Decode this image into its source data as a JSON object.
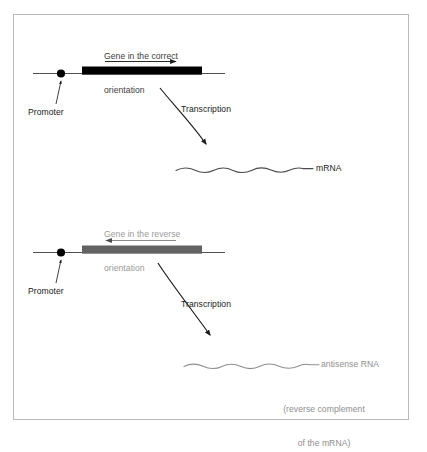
{
  "figure": {
    "border_color": "#b9b9b9",
    "background": "#ffffff"
  },
  "panels": [
    {
      "id": "correct-orientation",
      "caption": "Gene in the correct\norientation",
      "caption_line1": "Gene in the correct",
      "caption_line2": "orientation",
      "caption_color": "#3d3d3d",
      "gene_bar_color": "#000000",
      "gene_bar_label": "gene body (correct orientation)",
      "backbone_color": "#5a5a5a",
      "promoter_label": "Promoter",
      "promoter_dot_color": "#000000",
      "direction_arrow": "right",
      "transcription_label": "Transcription",
      "transcript_label": "mRNA",
      "transcript_color": "#4a4a4a",
      "transcript_note": ""
    },
    {
      "id": "reverse-orientation",
      "caption": "Gene in the reverse\norientation",
      "caption_line1": "Gene in the reverse",
      "caption_line2": "orientation",
      "caption_color": "#9a9a9a",
      "gene_bar_color": "#636363",
      "gene_bar_label": "gene body (reverse orientation)",
      "backbone_color": "#5a5a5a",
      "promoter_label": "Promoter",
      "promoter_dot_color": "#000000",
      "direction_arrow": "left",
      "transcription_label": "Transcription",
      "transcript_label": "antisense RNA",
      "transcript_color": "#8e8e8e",
      "transcript_note_line1": "(reverse complement",
      "transcript_note_line2": "of the mRNA)"
    }
  ],
  "colors": {
    "black": "#000000",
    "gene_gray": "#636363",
    "line_gray": "#5a5a5a",
    "text_gray": "#9a9a9a",
    "border": "#b9b9b9"
  }
}
